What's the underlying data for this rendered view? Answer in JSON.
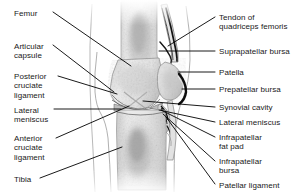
{
  "figure": {
    "type": "anatomical-illustration",
    "width": 307,
    "height": 196,
    "background_color": "#ffffff",
    "label_color": "#191919",
    "leader_color": "#000000"
  },
  "labels_left": [
    {
      "id": "femur",
      "text": "Femur",
      "x": 14,
      "y": 9,
      "w": 52
    },
    {
      "id": "articular-capsule",
      "text": "Articular\ncapsule",
      "x": 14,
      "y": 42,
      "w": 52
    },
    {
      "id": "posterior-cruciate-ligament",
      "text": "Posterior\ncruciate\nligament",
      "x": 14,
      "y": 72,
      "w": 52
    },
    {
      "id": "lateral-meniscus-left",
      "text": "Lateral\nmeniscus",
      "x": 14,
      "y": 106,
      "w": 52
    },
    {
      "id": "anterior-cruciate-ligament",
      "text": "Anterior\ncruciate\nligament",
      "x": 14,
      "y": 134,
      "w": 52
    },
    {
      "id": "tibia",
      "text": "Tibia",
      "x": 14,
      "y": 175,
      "w": 52
    }
  ],
  "labels_right": [
    {
      "id": "tendon-of-quadriceps-femoris",
      "text": "Tendon of\nquadriceps femoris",
      "x": 219,
      "y": 13,
      "w": 86
    },
    {
      "id": "suprapatellar-bursa",
      "text": "Suprapatellar bursa",
      "x": 219,
      "y": 47,
      "w": 86
    },
    {
      "id": "patella",
      "text": "Patella",
      "x": 219,
      "y": 68,
      "w": 86
    },
    {
      "id": "prepatellar-bursa",
      "text": "Prepatellar bursa",
      "x": 219,
      "y": 85,
      "w": 86
    },
    {
      "id": "synovial-cavity",
      "text": "Synovial cavity",
      "x": 219,
      "y": 103,
      "w": 86
    },
    {
      "id": "lateral-meniscus-right",
      "text": "Lateral meniscus",
      "x": 219,
      "y": 118,
      "w": 86
    },
    {
      "id": "infrapatellar-fat-pad",
      "text": "Infrapatellar\nfat pad",
      "x": 219,
      "y": 133,
      "w": 86
    },
    {
      "id": "infrapatellar-bursa",
      "text": "Infrapatellar\nbursa",
      "x": 219,
      "y": 157,
      "w": 86
    },
    {
      "id": "patellar-ligament",
      "text": "Patellar ligament",
      "x": 219,
      "y": 181,
      "w": 86
    }
  ],
  "leaders_left": [
    {
      "id": "leader-femur",
      "x1": 53,
      "y1": 12,
      "x2": 131,
      "y2": 66
    },
    {
      "id": "leader-articular-capsule",
      "x1": 53,
      "y1": 45,
      "x2": 114,
      "y2": 92
    },
    {
      "id": "leader-posterior-cruciate-ligament",
      "x1": 58,
      "y1": 76,
      "x2": 117,
      "y2": 94
    },
    {
      "id": "leader-lateral-meniscus-left",
      "x1": 54,
      "y1": 109,
      "x2": 121,
      "y2": 109
    },
    {
      "id": "leader-anterior-cruciate-ligament",
      "x1": 56,
      "y1": 138,
      "x2": 129,
      "y2": 106
    },
    {
      "id": "leader-tibia",
      "x1": 40,
      "y1": 178,
      "x2": 122,
      "y2": 147
    }
  ],
  "leaders_right": [
    {
      "id": "leader-tendon-of-quadriceps-femoris",
      "x1": 215,
      "y1": 17,
      "x2": 168,
      "y2": 46
    },
    {
      "id": "leader-suprapatellar-bursa",
      "x1": 215,
      "y1": 51,
      "x2": 159,
      "y2": 51
    },
    {
      "id": "leader-patella",
      "x1": 215,
      "y1": 72,
      "x2": 178,
      "y2": 72
    },
    {
      "id": "leader-prepatellar-bursa",
      "x1": 215,
      "y1": 89,
      "x2": 182,
      "y2": 89
    },
    {
      "id": "leader-synovial-cavity",
      "x1": 215,
      "y1": 107,
      "x2": 143,
      "y2": 101
    },
    {
      "id": "leader-lateral-meniscus-right",
      "x1": 215,
      "y1": 122,
      "x2": 159,
      "y2": 110
    },
    {
      "id": "leader-infrapatellar-fat-pad",
      "x1": 215,
      "y1": 137,
      "x2": 161,
      "y2": 110
    },
    {
      "id": "leader-infrapatellar-bursa",
      "x1": 215,
      "y1": 161,
      "x2": 163,
      "y2": 114
    },
    {
      "id": "leader-patellar-ligament",
      "x1": 215,
      "y1": 184,
      "x2": 166,
      "y2": 117
    }
  ],
  "structures": [
    {
      "id": "femur-shaft",
      "name": "Femur shaft"
    },
    {
      "id": "femoral-condyle",
      "name": "Femoral condyle"
    },
    {
      "id": "patella-bone",
      "name": "Patella"
    },
    {
      "id": "quadriceps-tendon",
      "name": "Tendon of quadriceps femoris"
    },
    {
      "id": "prepatellar-bursa-shape",
      "name": "Prepatellar bursa"
    },
    {
      "id": "suprapatellar-bursa-shape",
      "name": "Suprapatellar bursa"
    },
    {
      "id": "lateral-meniscus-shape",
      "name": "Lateral meniscus"
    },
    {
      "id": "infrapatellar-fat-pad-shape",
      "name": "Infrapatellar fat pad"
    },
    {
      "id": "patellar-ligament-shape",
      "name": "Patellar ligament"
    },
    {
      "id": "tibia-shaft",
      "name": "Tibia shaft"
    },
    {
      "id": "articular-capsule-outline",
      "name": "Articular capsule"
    }
  ]
}
